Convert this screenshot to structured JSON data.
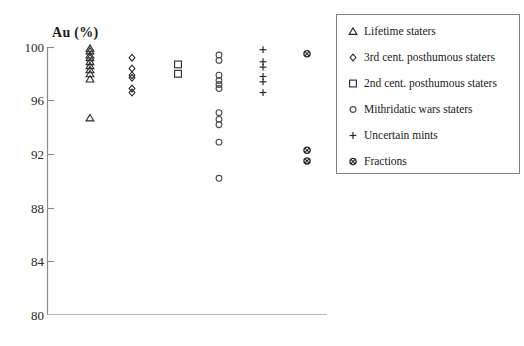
{
  "title": "Au (%)",
  "chart_data": {
    "type": "scatter",
    "title": "Au (%)",
    "ylabel": "Au (%)",
    "xlabel": "",
    "ylim": [
      80,
      100
    ],
    "y_ticks": [
      "100",
      "96",
      "92",
      "88",
      "84",
      "80"
    ],
    "y_tick_values": [
      100,
      96,
      92,
      88,
      84,
      80
    ],
    "grid": false,
    "legend_position": "right",
    "marker_color": "#2a2a2a",
    "series": [
      {
        "name": "Lifetime staters",
        "marker": "triangle",
        "values": [
          99.9,
          99.7,
          99.4,
          99.2,
          98.9,
          98.6,
          98.3,
          98.0,
          97.6,
          94.7
        ]
      },
      {
        "name": "3rd cent. posthumous staters",
        "marker": "diamond",
        "values": [
          99.2,
          98.4,
          97.9,
          97.7,
          96.9,
          96.6
        ]
      },
      {
        "name": "2nd cent. posthumous staters",
        "marker": "square",
        "values": [
          98.7,
          98.0
        ]
      },
      {
        "name": "Mithridatic wars staters",
        "marker": "circle",
        "values": [
          99.4,
          99.0,
          97.9,
          97.5,
          97.2,
          96.9,
          95.1,
          94.6,
          94.2,
          92.9,
          90.2
        ]
      },
      {
        "name": "Uncertain mints",
        "marker": "plus",
        "values": [
          99.8,
          98.9,
          98.5,
          97.8,
          97.4,
          96.6
        ]
      },
      {
        "name": "Fractions",
        "marker": "circle-x",
        "values": [
          99.5,
          92.3,
          91.5
        ]
      }
    ]
  }
}
